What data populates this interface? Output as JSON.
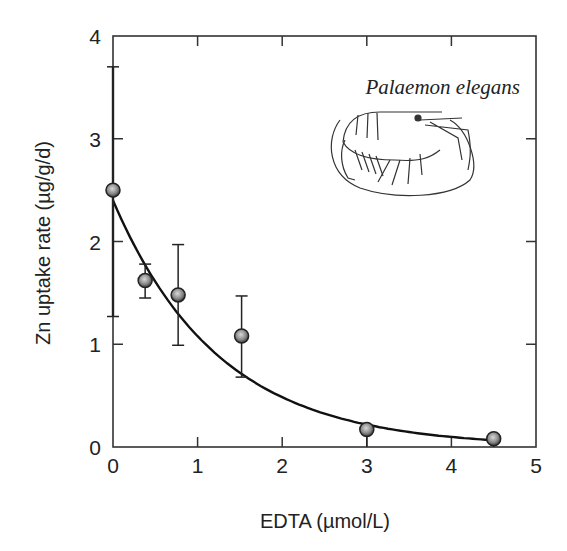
{
  "chart_data": {
    "type": "scatter",
    "title": "",
    "xlabel": "EDTA (µmol/L)",
    "ylabel": "Zn uptake rate (µg/g/d)",
    "xlim": [
      0,
      5
    ],
    "ylim": [
      0,
      4
    ],
    "xticks": [
      0,
      1,
      2,
      3,
      4,
      5
    ],
    "yticks": [
      0,
      1,
      2,
      3,
      4
    ],
    "grid": false,
    "legend": null,
    "annotation": "Palaemon elegans",
    "series": [
      {
        "name": "Observed",
        "type": "scatter",
        "x": [
          0,
          0.38,
          0.77,
          1.52,
          3.0,
          4.5
        ],
        "y": [
          2.5,
          1.62,
          1.48,
          1.08,
          0.17,
          0.08
        ],
        "err_low": [
          1.27,
          1.45,
          0.99,
          0.68,
          0.0,
          0.0
        ],
        "err_high": [
          3.7,
          1.78,
          1.97,
          1.47,
          0.17,
          0.08
        ]
      },
      {
        "name": "Fitted curve",
        "type": "line",
        "equation": "y = 2.4 * exp(-0.8 x)",
        "x": [
          0,
          0.5,
          1.0,
          1.5,
          2.0,
          2.5,
          3.0,
          3.5,
          4.0,
          4.5
        ],
        "y": [
          2.4,
          1.61,
          1.08,
          0.72,
          0.48,
          0.32,
          0.22,
          0.15,
          0.1,
          0.07
        ]
      }
    ]
  }
}
